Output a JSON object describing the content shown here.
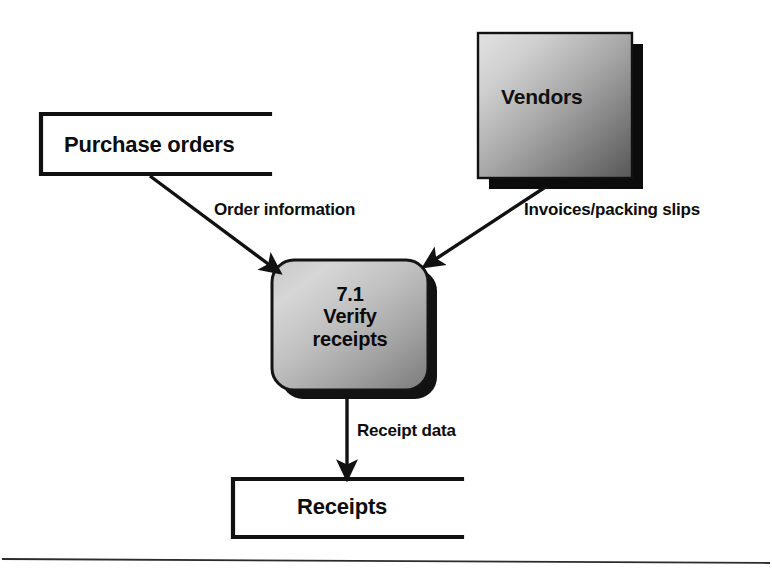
{
  "diagram": {
    "type": "data-flow-diagram",
    "background_color": "#ffffff",
    "line_color": "#111111",
    "text_color": "#0d0d0d",
    "nodes": [
      {
        "id": "purchase-orders",
        "kind": "data-store",
        "label": "Purchase orders",
        "shape": "open-ended-rectangle",
        "x": 41,
        "y": 113,
        "width": 229,
        "height": 62
      },
      {
        "id": "vendors",
        "kind": "external-entity",
        "label": "Vendors",
        "shape": "shadowed-rectangle",
        "x": 478,
        "y": 33,
        "width": 154,
        "height": 145,
        "fill_light": "#dcdcdc",
        "fill_dark": "#5a5a5a",
        "shadow_color": "#0c0c0c"
      },
      {
        "id": "verify-receipts",
        "kind": "process",
        "number": "7.1",
        "label_line_1": "7.1",
        "label_line_2": "Verify",
        "label_line_3": "receipts",
        "shape": "rounded-rectangle",
        "x": 272,
        "y": 260,
        "width": 156,
        "height": 130,
        "corner_radius": 22,
        "fill_light": "#d2d2d2",
        "fill_dark": "#7d7d7d",
        "shadow_color": "#111111"
      },
      {
        "id": "receipts",
        "kind": "data-store",
        "label": "Receipts",
        "shape": "open-ended-rectangle",
        "x": 233,
        "y": 478,
        "width": 229,
        "height": 60
      }
    ],
    "flows": [
      {
        "id": "order-information",
        "label": "Order information",
        "from": "purchase-orders",
        "to": "verify-receipts",
        "direction": "down-right"
      },
      {
        "id": "invoices-packing-slips",
        "label": "Invoices/packing slips",
        "from": "vendors",
        "to": "verify-receipts",
        "direction": "down-left"
      },
      {
        "id": "receipt-data",
        "label": "Receipt data",
        "from": "verify-receipts",
        "to": "receipts",
        "direction": "down"
      }
    ],
    "footer_rule": {
      "id": "page-rule",
      "visible": true,
      "y": 560
    }
  }
}
